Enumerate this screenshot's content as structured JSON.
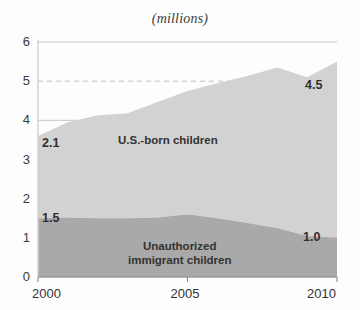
{
  "chart_data": {
    "type": "area",
    "stacked": true,
    "title": "(millions)",
    "xlabel": "",
    "ylabel": "",
    "xlim": [
      2000,
      2010
    ],
    "ylim": [
      0,
      6
    ],
    "yticks": [
      0,
      1,
      2,
      3,
      4,
      5,
      6
    ],
    "ytick_labels": [
      "0",
      "1",
      "2",
      "3",
      "4",
      "5",
      "6"
    ],
    "xticks": [
      2000,
      2005,
      2010
    ],
    "xtick_labels": [
      "2000",
      "2005",
      "2010"
    ],
    "grid": true,
    "legend": "inline-annotations",
    "x": [
      2000,
      2001,
      2002,
      2003,
      2004,
      2005,
      2006,
      2007,
      2008,
      2009,
      2010
    ],
    "series": [
      {
        "name": "Unauthorized immigrant children",
        "color": "#a9a9a9",
        "values": [
          1.5,
          1.52,
          1.5,
          1.5,
          1.52,
          1.6,
          1.5,
          1.38,
          1.25,
          1.05,
          1.0
        ],
        "label_start": "1.5",
        "label_end": "1.0"
      },
      {
        "name": "U.S.-born children",
        "color": "#d2d2d2",
        "values": [
          2.1,
          2.43,
          2.63,
          2.68,
          2.95,
          3.15,
          3.45,
          3.75,
          4.1,
          4.05,
          4.5
        ],
        "label_start": "2.1",
        "label_end": "4.5"
      }
    ],
    "totals": [
      3.6,
      3.95,
      4.13,
      4.18,
      4.47,
      4.75,
      4.95,
      5.13,
      5.35,
      5.1,
      5.5
    ],
    "annotations": [
      {
        "text": "2.1",
        "series": "U.S.-born children",
        "position": "left"
      },
      {
        "text": "4.5",
        "series": "U.S.-born children",
        "position": "right"
      },
      {
        "text": "1.5",
        "series": "Unauthorized immigrant children",
        "position": "left"
      },
      {
        "text": "1.0",
        "series": "Unauthorized immigrant children",
        "position": "right"
      }
    ],
    "series_label_upper": "U.S.-born children",
    "series_label_lower": "Unauthorized\nimmigrant children"
  },
  "colors": {
    "background": "#fdfdfd",
    "upper_area": "#d2d2d2",
    "lower_area": "#a9a9a9",
    "gridline": "#b9b9b9",
    "axis": "#8c8c8c",
    "text": "#333333"
  }
}
